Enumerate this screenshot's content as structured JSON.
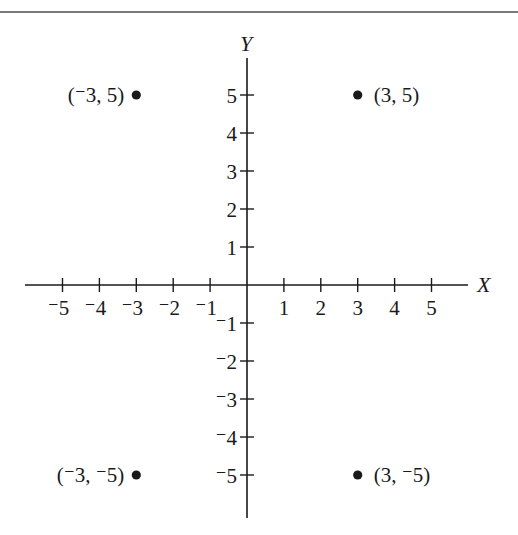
{
  "chart_data": {
    "type": "scatter",
    "title": "",
    "xlabel": "X",
    "ylabel": "Y",
    "xlim": [
      -5,
      5
    ],
    "ylim": [
      -5,
      5
    ],
    "grid": false,
    "x_ticks": [
      -5,
      -4,
      -3,
      -2,
      -1,
      1,
      2,
      3,
      4,
      5
    ],
    "y_ticks": [
      5,
      4,
      3,
      2,
      1,
      -1,
      -2,
      -3,
      -4,
      -5
    ],
    "x_tick_labels": [
      "⁻5",
      "⁻4",
      "⁻3",
      "⁻2",
      "⁻1",
      "1",
      "2",
      "3",
      "4",
      "5"
    ],
    "y_tick_labels": [
      "5",
      "4",
      "3",
      "2",
      "1",
      "⁻1",
      "⁻2",
      "⁻3",
      "⁻4",
      "⁻5"
    ],
    "points": [
      {
        "x": -3,
        "y": 5,
        "label": "(⁻3, 5)"
      },
      {
        "x": 3,
        "y": 5,
        "label": "(3, 5)"
      },
      {
        "x": -3,
        "y": -5,
        "label": "(⁻3, ⁻5)"
      },
      {
        "x": 3,
        "y": -5,
        "label": "(3, ⁻5)"
      }
    ],
    "colors": {
      "ink": "#1a1a1a",
      "rule": "#7a7a7a"
    }
  }
}
